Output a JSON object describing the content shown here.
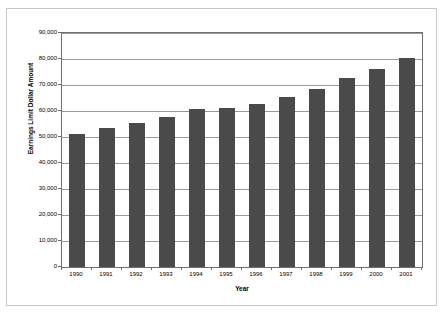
{
  "chart_data": {
    "type": "bar",
    "title": "",
    "xlabel": "Year",
    "ylabel": "Earnings Limit Dollar Amount",
    "categories": [
      "1990",
      "1991",
      "1992",
      "1993",
      "1994",
      "1995",
      "1996",
      "1997",
      "1998",
      "1999",
      "2000",
      "2001"
    ],
    "values": [
      51300,
      53400,
      55500,
      57600,
      60600,
      61200,
      62700,
      65400,
      68400,
      72600,
      76200,
      80400
    ],
    "ylim": [
      0,
      90000
    ],
    "ytick_values": [
      0,
      10000,
      20000,
      30000,
      40000,
      50000,
      60000,
      70000,
      80000,
      90000
    ],
    "ytick_labels": [
      "0",
      "10,000",
      "20,000",
      "30,000",
      "40,000",
      "50,000",
      "60,000",
      "70,000",
      "80,000",
      "90,000"
    ],
    "grid": true,
    "legend": "none",
    "series": [
      {
        "name": "Earnings Limit Dollar Amount",
        "color": "#4a4a4a",
        "values": [
          51300,
          53400,
          55500,
          57600,
          60600,
          61200,
          62700,
          65400,
          68400,
          72600,
          76200,
          80400
        ]
      }
    ]
  }
}
